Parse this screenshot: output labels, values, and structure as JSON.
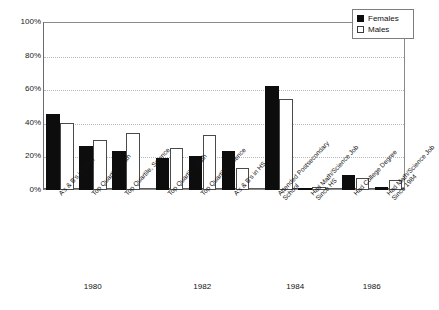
{
  "legend": {
    "position": "top-right",
    "entries": [
      {
        "name": "Females",
        "swatch": "filled-black-square"
      },
      {
        "name": "Males",
        "swatch": "open-white-square"
      }
    ]
  },
  "axis": {
    "y_ticks": [
      "0%",
      "20%",
      "40%",
      "60%",
      "80%",
      "100%"
    ]
  },
  "years": [
    "1980",
    "1982",
    "1984",
    "1986"
  ],
  "chart_data": {
    "type": "bar",
    "title": "",
    "subtitle": "",
    "xlabel": "",
    "ylabel": "",
    "ylim": [
      0,
      100
    ],
    "ytick_values": [
      0,
      20,
      40,
      60,
      80,
      100
    ],
    "ytick_labels": [
      "0%",
      "20%",
      "40%",
      "60%",
      "80%",
      "100%"
    ],
    "grid": "horizontal-dotted",
    "legend_position": "top-right",
    "group_labels": [
      "1980",
      "1982",
      "1984",
      "1986"
    ],
    "categories": [
      "A's & B's in Math",
      "Top Quartile, Math",
      "Top Quartile, Science",
      "Top Quartile, Math",
      "Top Quartile, Science",
      "A's & B's in HS",
      "Attended Postsecondary School",
      "Had Math/Science Job Since HS",
      "Had College Degree",
      "Had Math/Science Job Since 1984"
    ],
    "category_lines": [
      [
        "A's & B's in Math"
      ],
      [
        "Top Quartile, Math"
      ],
      [
        "Top Quartile, Science"
      ],
      [
        "Top Quartile, Math"
      ],
      [
        "Top Quartile, Science"
      ],
      [
        "A's & B's in HS"
      ],
      [
        "Attended Postsecondary",
        "School"
      ],
      [
        "Had Math/Science Job",
        "Since HS"
      ],
      [
        "Had College Degree"
      ],
      [
        "Had Math/Science Job",
        "Since 1984"
      ]
    ],
    "category_groups": [
      0,
      0,
      0,
      1,
      1,
      1,
      2,
      2,
      3,
      3
    ],
    "series": [
      {
        "name": "Females",
        "color": "#0d0d0d",
        "values": [
          45,
          26,
          23,
          19,
          20,
          23,
          62,
          0.5,
          9,
          2
        ]
      },
      {
        "name": "Males",
        "color": "#ffffff",
        "values": [
          40,
          30,
          34,
          25,
          33,
          13,
          54,
          2,
          7,
          6
        ]
      }
    ]
  }
}
